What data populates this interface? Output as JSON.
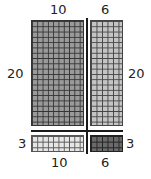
{
  "diagram": {
    "top_labels": [
      "10",
      "6"
    ],
    "bottom_labels": [
      "10",
      "6"
    ],
    "left_labels": [
      "20",
      "3"
    ],
    "right_labels": [
      "20",
      "3"
    ],
    "regions": [
      {
        "name": "top-left",
        "rows": 20,
        "cols": 10,
        "fill": "#9a9a9a",
        "line": "#333333"
      },
      {
        "name": "top-right",
        "rows": 20,
        "cols": 6,
        "fill": "#c4c4c4",
        "line": "#444444"
      },
      {
        "name": "bottom-left",
        "rows": 3,
        "cols": 10,
        "fill": "#e6e6e6",
        "line": "#555555"
      },
      {
        "name": "bottom-right",
        "rows": 3,
        "cols": 6,
        "fill": "#6a6a6a",
        "line": "#222222"
      }
    ]
  }
}
